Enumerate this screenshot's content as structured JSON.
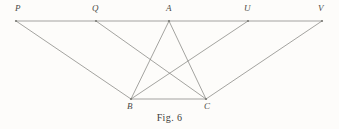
{
  "figure": {
    "caption": "Fig. 6",
    "background_color": "#fdfcfa",
    "stroke_color": "#7d7d78",
    "label_color": "#4a4a46",
    "canvas": {
      "width": 339,
      "height": 129
    },
    "points": [
      {
        "id": "P",
        "label": "P",
        "x": 16,
        "y": 21,
        "label_x": 15,
        "label_y": 4
      },
      {
        "id": "Q",
        "label": "Q",
        "x": 96,
        "y": 21,
        "label_x": 92,
        "label_y": 4
      },
      {
        "id": "A",
        "label": "A",
        "x": 169,
        "y": 21,
        "label_x": 166,
        "label_y": 4
      },
      {
        "id": "U",
        "label": "U",
        "x": 248,
        "y": 21,
        "label_x": 244,
        "label_y": 4
      },
      {
        "id": "V",
        "label": "V",
        "x": 322,
        "y": 21,
        "label_x": 318,
        "label_y": 4
      },
      {
        "id": "B",
        "label": "B",
        "x": 131,
        "y": 99,
        "label_x": 127,
        "label_y": 102
      },
      {
        "id": "C",
        "label": "C",
        "x": 206,
        "y": 99,
        "label_x": 204,
        "label_y": 102
      }
    ],
    "segments": [
      {
        "name": "line-PV-top-horizontal",
        "from": "P",
        "to": "V",
        "x1": 16,
        "y1": 21,
        "x2": 322,
        "y2": 21
      },
      {
        "name": "line-A-B-triangle-side",
        "from": "A",
        "to": "B",
        "x1": 169,
        "y1": 21,
        "x2": 131,
        "y2": 99
      },
      {
        "name": "line-A-C-triangle-side",
        "from": "A",
        "to": "C",
        "x1": 169,
        "y1": 21,
        "x2": 206,
        "y2": 99
      },
      {
        "name": "line-B-C-triangle-base",
        "from": "B",
        "to": "C",
        "x1": 131,
        "y1": 99,
        "x2": 206,
        "y2": 99
      },
      {
        "name": "line-P-B",
        "from": "P",
        "to": "B",
        "x1": 16,
        "y1": 21,
        "x2": 131,
        "y2": 99
      },
      {
        "name": "line-Q-C",
        "from": "Q",
        "to": "C",
        "x1": 96,
        "y1": 21,
        "x2": 206,
        "y2": 99
      },
      {
        "name": "line-U-B",
        "from": "U",
        "to": "B",
        "x1": 248,
        "y1": 21,
        "x2": 131,
        "y2": 99
      },
      {
        "name": "line-V-C",
        "from": "V",
        "to": "C",
        "x1": 322,
        "y1": 21,
        "x2": 206,
        "y2": 99
      }
    ]
  }
}
